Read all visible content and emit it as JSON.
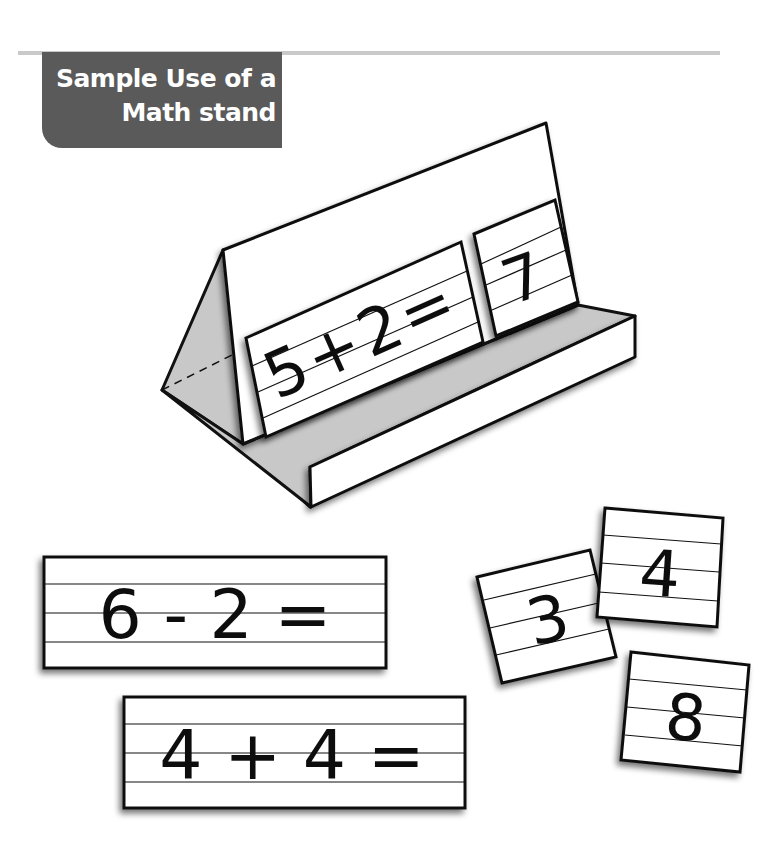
{
  "header": {
    "title_line1": "Sample Use of a",
    "title_line2": "Math stand",
    "title_bg_color": "#5a5a5a",
    "rule_color": "#c9c9c9"
  },
  "stand": {
    "front_card": {
      "text": "5+2="
    },
    "answer_card": {
      "text": "7"
    },
    "shade_color": "#c8c8c8"
  },
  "equation_cards": [
    {
      "text": "6 - 2 ="
    },
    {
      "text": "4 + 4 ="
    }
  ],
  "number_cards": [
    {
      "text": "3"
    },
    {
      "text": "4"
    },
    {
      "text": "8"
    }
  ]
}
